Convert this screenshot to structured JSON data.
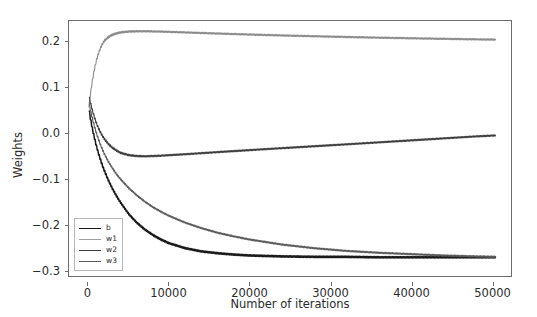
{
  "chart_data": {
    "type": "line",
    "title": "",
    "xlabel": "Number of iterations",
    "ylabel": "Weights",
    "xlim": [
      -2400,
      52400
    ],
    "ylim": [
      -0.313,
      0.246
    ],
    "grid": false,
    "legend_position": "lower left",
    "xticks": [
      0,
      10000,
      20000,
      30000,
      40000,
      50000
    ],
    "xtick_labels": [
      "0",
      "10000",
      "20000",
      "30000",
      "40000",
      "50000"
    ],
    "yticks": [
      0.2,
      0.1,
      0.0,
      -0.1,
      -0.2,
      -0.3
    ],
    "ytick_labels": [
      "0.2",
      "0.1",
      "0.0",
      "−0.1",
      "−0.2",
      "−0.3"
    ],
    "series": [
      {
        "name": "b",
        "color": "#1a1a1a",
        "x": [
          0,
          250,
          500,
          750,
          1000,
          1250,
          1500,
          1750,
          2000,
          2500,
          3000,
          3500,
          4000,
          5000,
          6000,
          7000,
          8000,
          9000,
          10000,
          12000,
          14000,
          16000,
          18000,
          20000,
          24000,
          28000,
          32000,
          36000,
          40000,
          44000,
          48000,
          50500
        ],
        "values": [
          0.062,
          0.033,
          0.01,
          -0.01,
          -0.028,
          -0.044,
          -0.058,
          -0.071,
          -0.083,
          -0.104,
          -0.122,
          -0.138,
          -0.152,
          -0.177,
          -0.196,
          -0.211,
          -0.223,
          -0.233,
          -0.241,
          -0.252,
          -0.259,
          -0.263,
          -0.266,
          -0.268,
          -0.27,
          -0.271,
          -0.271,
          -0.272,
          -0.272,
          -0.272,
          -0.272,
          -0.272
        ]
      },
      {
        "name": "w1",
        "color": "#8a8a8a",
        "x": [
          0,
          250,
          500,
          750,
          1000,
          1250,
          1500,
          1750,
          2000,
          2500,
          3000,
          3500,
          4000,
          5000,
          6000,
          7000,
          8000,
          9000,
          10000,
          12000,
          14000,
          16000,
          18000,
          20000,
          24000,
          28000,
          32000,
          36000,
          40000,
          44000,
          48000,
          50500
        ],
        "values": [
          0.05,
          0.085,
          0.115,
          0.14,
          0.16,
          0.175,
          0.187,
          0.196,
          0.203,
          0.211,
          0.216,
          0.219,
          0.221,
          0.223,
          0.2235,
          0.2235,
          0.2232,
          0.2228,
          0.2222,
          0.221,
          0.2198,
          0.2186,
          0.2175,
          0.2164,
          0.2144,
          0.2126,
          0.211,
          0.2095,
          0.2082,
          0.207,
          0.2058,
          0.2052
        ]
      },
      {
        "name": "w2",
        "color": "#3d3d3d",
        "x": [
          0,
          250,
          500,
          750,
          1000,
          1250,
          1500,
          1750,
          2000,
          2500,
          3000,
          3500,
          4000,
          5000,
          6000,
          7000,
          8000,
          9000,
          10000,
          12000,
          14000,
          16000,
          18000,
          20000,
          24000,
          28000,
          32000,
          36000,
          40000,
          44000,
          48000,
          50500
        ],
        "values": [
          0.088,
          0.068,
          0.05,
          0.035,
          0.022,
          0.011,
          0.002,
          -0.006,
          -0.013,
          -0.024,
          -0.032,
          -0.038,
          -0.043,
          -0.048,
          -0.05,
          -0.0505,
          -0.05,
          -0.0492,
          -0.0482,
          -0.046,
          -0.0437,
          -0.0414,
          -0.0392,
          -0.037,
          -0.0327,
          -0.0285,
          -0.0243,
          -0.02,
          -0.0157,
          -0.0113,
          -0.007,
          -0.0048
        ]
      },
      {
        "name": "w3",
        "color": "#5a5a5a",
        "x": [
          0,
          250,
          500,
          750,
          1000,
          1250,
          1500,
          1750,
          2000,
          2500,
          3000,
          3500,
          4000,
          5000,
          6000,
          7000,
          8000,
          9000,
          10000,
          12000,
          14000,
          16000,
          18000,
          20000,
          24000,
          28000,
          32000,
          36000,
          40000,
          44000,
          48000,
          50500
        ],
        "values": [
          0.075,
          0.052,
          0.032,
          0.015,
          0.0,
          -0.013,
          -0.025,
          -0.036,
          -0.046,
          -0.063,
          -0.077,
          -0.09,
          -0.101,
          -0.12,
          -0.136,
          -0.15,
          -0.162,
          -0.172,
          -0.181,
          -0.196,
          -0.208,
          -0.218,
          -0.226,
          -0.233,
          -0.244,
          -0.252,
          -0.258,
          -0.262,
          -0.265,
          -0.268,
          -0.27,
          -0.271
        ]
      }
    ],
    "legend_entries": [
      {
        "label": "b",
        "color": "#1a1a1a"
      },
      {
        "label": "w1",
        "color": "#9e9e9e"
      },
      {
        "label": "w2",
        "color": "#3d3d3d"
      },
      {
        "label": "w3",
        "color": "#5a5a5a"
      }
    ]
  }
}
